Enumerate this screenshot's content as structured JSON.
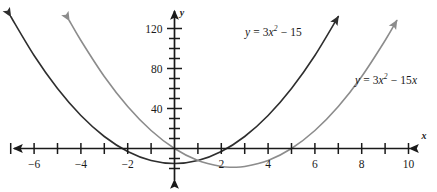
{
  "chart_data": {
    "type": "line",
    "title": "",
    "xlabel": "x",
    "ylabel": "y",
    "xlim": [
      -7.4,
      11.2
    ],
    "ylim": [
      -22,
      133
    ],
    "grid": false,
    "legend_position": "inline-annotation",
    "x_ticks": [
      -7,
      -6,
      -5,
      -4,
      -3,
      -2,
      -1,
      1,
      2,
      3,
      4,
      5,
      6,
      7,
      8,
      9,
      10
    ],
    "x_tick_labels": [
      {
        "value": -6,
        "label": "−6"
      },
      {
        "value": -4,
        "label": "−4"
      },
      {
        "value": -2,
        "label": "−2"
      },
      {
        "value": 2,
        "label": "2"
      },
      {
        "value": 4,
        "label": "4"
      },
      {
        "value": 6,
        "label": "6"
      },
      {
        "value": 8,
        "label": "8"
      },
      {
        "value": 10,
        "label": "10"
      }
    ],
    "y_ticks": [
      -20,
      -10,
      10,
      20,
      30,
      40,
      50,
      60,
      70,
      80,
      90,
      100,
      110,
      120
    ],
    "y_tick_labels": [
      {
        "value": 40,
        "label": "40"
      },
      {
        "value": 80,
        "label": "80"
      },
      {
        "value": 120,
        "label": "120"
      }
    ],
    "series": [
      {
        "name": "y = 3x² − 15",
        "expression": "3*x^2 - 15",
        "color": "#2e2e2e",
        "vertex": [
          0,
          -15
        ],
        "roots": [
          -2.236,
          2.236
        ],
        "arrow_ends": "both",
        "annotation": {
          "html": "<i>y</i> = 3<i>x</i><sup>2</sup> − 15",
          "plain": "y = 3x2 − 15"
        },
        "points": [
          {
            "x": -7.0,
            "y": 132
          },
          {
            "x": -6.0,
            "y": 93
          },
          {
            "x": -5.0,
            "y": 60
          },
          {
            "x": -4.0,
            "y": 33
          },
          {
            "x": -3.0,
            "y": 12
          },
          {
            "x": -2.0,
            "y": -3
          },
          {
            "x": -1.0,
            "y": -12
          },
          {
            "x": 0.0,
            "y": -15
          },
          {
            "x": 1.0,
            "y": -12
          },
          {
            "x": 2.0,
            "y": -3
          },
          {
            "x": 3.0,
            "y": 12
          },
          {
            "x": 4.0,
            "y": 33
          },
          {
            "x": 5.0,
            "y": 60
          },
          {
            "x": 6.0,
            "y": 93
          },
          {
            "x": 7.0,
            "y": 132
          }
        ]
      },
      {
        "name": "y = 3x² − 15x",
        "expression": "3*x^2 - 15*x",
        "color": "#8c8c8c",
        "vertex": [
          2.5,
          -18.75
        ],
        "roots": [
          0,
          5
        ],
        "arrow_ends": "both",
        "annotation": {
          "html": "<i>y</i> = 3<i>x</i><sup>2</sup> − 15<i>x</i>",
          "plain": "y = 3x2 − 15x"
        },
        "points": [
          {
            "x": -4.5,
            "y": 128
          },
          {
            "x": -4.0,
            "y": 108
          },
          {
            "x": -3.0,
            "y": 72
          },
          {
            "x": -2.0,
            "y": 42
          },
          {
            "x": -1.0,
            "y": 18
          },
          {
            "x": 0.0,
            "y": 0
          },
          {
            "x": 1.0,
            "y": -12
          },
          {
            "x": 2.0,
            "y": -18
          },
          {
            "x": 2.5,
            "y": -18.75
          },
          {
            "x": 3.0,
            "y": -18
          },
          {
            "x": 4.0,
            "y": -12
          },
          {
            "x": 5.0,
            "y": 0
          },
          {
            "x": 6.0,
            "y": 18
          },
          {
            "x": 7.0,
            "y": 42
          },
          {
            "x": 8.0,
            "y": 72
          },
          {
            "x": 9.0,
            "y": 108
          },
          {
            "x": 9.5,
            "y": 128
          }
        ]
      }
    ]
  },
  "axes": {
    "x_axis_name": "x",
    "y_axis_name": "y"
  },
  "annotations": {
    "curve1_label": "y = 3x2 − 15",
    "curve2_label": "y = 3x2 − 15x"
  }
}
